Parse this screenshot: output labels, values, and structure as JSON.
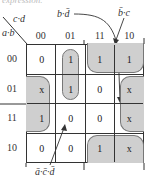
{
  "caption": "expression.",
  "axis": {
    "col_var": "c·d",
    "row_var": "a·b"
  },
  "columns": [
    "00",
    "01",
    "11",
    "10"
  ],
  "rows": [
    {
      "label": "00",
      "cells": [
        "0",
        "1",
        "1",
        "1"
      ]
    },
    {
      "label": "01",
      "cells": [
        "x",
        "1",
        "0",
        "x"
      ]
    },
    {
      "label": "11",
      "cells": [
        "1",
        "0",
        "0",
        "x"
      ]
    },
    {
      "label": "10",
      "cells": [
        "0",
        "0",
        "1",
        "x"
      ]
    }
  ],
  "groups": [
    {
      "term": "b·d̄",
      "cells": "rows 01,11 × cols 00,10 (wrap)"
    },
    {
      "term": "b̄·c",
      "cells": "rows 00,10 × cols 11,10 (wrap)"
    },
    {
      "term": "ā·c̄·d",
      "cells": "rows 00,01 × col 01"
    }
  ],
  "annotations": {
    "top_left": "b·d̄",
    "top_right": "b̄·c",
    "bottom": "ā·c̄·d̄"
  },
  "colors": {
    "group_fill": "#cfcfcf",
    "line": "#333333"
  }
}
